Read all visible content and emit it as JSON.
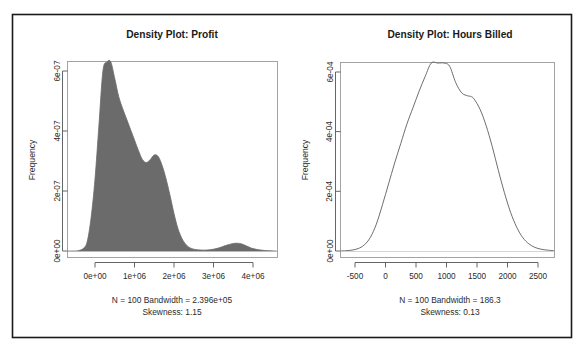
{
  "figure": {
    "background_color": "#ffffff",
    "frame_color": "#1a1a1a",
    "width": 584,
    "height": 354
  },
  "panels": [
    {
      "id": "profit",
      "title": "Density Plot: Profit",
      "ylabel": "Frequency",
      "caption_line1": "N = 100   Bandwidth = 2.396e+05",
      "caption_line2": "Skewness: 1.15",
      "fill_color": "#6b6b6b",
      "line_color": "#5e5e5e",
      "filled": true,
      "xticks": [
        "0e+00",
        "1e+06",
        "2e+06",
        "3e+06",
        "4e+06"
      ],
      "yticks": [
        "0e+00",
        "2e-07",
        "4e-07",
        "6e-07"
      ]
    },
    {
      "id": "hours-billed",
      "title": "Density Plot: Hours Billed",
      "ylabel": "Frequency",
      "caption_line1": "N = 100   Bandwidth = 186.3",
      "caption_line2": "Skewness: 0.13",
      "fill_color": "none",
      "line_color": "#5e5e5e",
      "filled": false,
      "xticks": [
        "-500",
        "0",
        "500",
        "1000",
        "1500",
        "2000",
        "2500"
      ],
      "yticks": [
        "0e+00",
        "2e-04",
        "4e-04",
        "6e-04"
      ]
    }
  ],
  "chart_data": [
    {
      "type": "area",
      "id": "profit",
      "title": "Density Plot: Profit",
      "xlabel": "",
      "ylabel": "Frequency",
      "n": 100,
      "bandwidth": 239600,
      "skewness": 1.15,
      "xlim": [
        -700000,
        4600000
      ],
      "ylim": [
        0,
        7.3e-07
      ],
      "xticks": [
        0,
        1000000,
        2000000,
        3000000,
        4000000
      ],
      "xtick_labels": [
        "0e+00",
        "1e+06",
        "2e+06",
        "3e+06",
        "4e+06"
      ],
      "yticks": [
        0,
        2e-07,
        4e-07,
        6e-07
      ],
      "ytick_labels": [
        "0e+00",
        "2e-07",
        "4e-07",
        "6e-07"
      ],
      "grid": false,
      "legend": "none",
      "fill": "#6b6b6b",
      "x": [
        -700000,
        -600000,
        -500000,
        -400000,
        -300000,
        -200000,
        -100000,
        0,
        100000,
        200000,
        300000,
        400000,
        500000,
        600000,
        700000,
        800000,
        900000,
        1000000,
        1100000,
        1200000,
        1300000,
        1400000,
        1500000,
        1600000,
        1700000,
        1800000,
        1900000,
        2000000,
        2100000,
        2200000,
        2300000,
        2400000,
        2500000,
        2600000,
        2700000,
        2800000,
        2900000,
        3000000,
        3100000,
        3200000,
        3300000,
        3400000,
        3500000,
        3600000,
        3700000,
        3800000,
        3900000,
        4000000,
        4200000,
        4400000,
        4600000
      ],
      "y": [
        0.0,
        0.0,
        0.0,
        2e-09,
        8e-09,
        3e-08,
        1.1e-07,
        2.4e-07,
        4.2e-07,
        6e-07,
        7.05e-07,
        6.6e-07,
        5.75e-07,
        5.15e-07,
        4.75e-07,
        4.4e-07,
        4.05e-07,
        3.7e-07,
        3.35e-07,
        3.05e-07,
        2.95e-07,
        3.05e-07,
        3.2e-07,
        3.15e-07,
        2.85e-07,
        2.4e-07,
        1.85e-07,
        1.25e-07,
        7.5e-08,
        4.2e-08,
        2.2e-08,
        1.1e-08,
        6e-09,
        4e-09,
        3e-09,
        3e-09,
        4e-09,
        6e-09,
        9e-09,
        1.3e-08,
        1.8e-08,
        2.2e-08,
        2.5e-08,
        2.6e-08,
        2.4e-08,
        1.9e-08,
        1.3e-08,
        8e-09,
        3e-09,
        1e-09,
        0.0
      ]
    },
    {
      "type": "line",
      "id": "hours-billed",
      "title": "Density Plot: Hours Billed",
      "xlabel": "",
      "ylabel": "Frequency",
      "n": 100,
      "bandwidth": 186.3,
      "skewness": 0.13,
      "xlim": [
        -750,
        2800
      ],
      "ylim": [
        0,
        0.00069
      ],
      "xticks": [
        -500,
        0,
        500,
        1000,
        1500,
        2000,
        2500
      ],
      "xtick_labels": [
        "-500",
        "0",
        "500",
        "1000",
        "1500",
        "2000",
        "2500"
      ],
      "yticks": [
        0,
        0.0002,
        0.0004,
        0.0006
      ],
      "ytick_labels": [
        "0e+00",
        "2e-04",
        "4e-04",
        "6e-04"
      ],
      "grid": false,
      "legend": "none",
      "fill": "none",
      "x": [
        -750,
        -650,
        -550,
        -450,
        -350,
        -250,
        -150,
        -50,
        50,
        150,
        250,
        350,
        450,
        550,
        650,
        750,
        850,
        900,
        950,
        1050,
        1150,
        1250,
        1350,
        1400,
        1450,
        1550,
        1650,
        1750,
        1850,
        1950,
        2050,
        2150,
        2250,
        2350,
        2450,
        2550,
        2650,
        2750,
        2800
      ],
      "y": [
        0.0,
        1e-06,
        3e-06,
        8e-06,
        2e-05,
        4.5e-05,
        9e-05,
        0.000155,
        0.000225,
        0.000295,
        0.00036,
        0.000425,
        0.00048,
        0.000535,
        0.000585,
        0.00063,
        0.00066,
        0.000662,
        0.000655,
        0.00062,
        0.000565,
        0.00053,
        0.00052,
        0.000518,
        0.00051,
        0.000475,
        0.00042,
        0.00035,
        0.00027,
        0.000195,
        0.00013,
        8e-05,
        4.5e-05,
        2.4e-05,
        1.2e-05,
        6e-06,
        3e-06,
        1e-06,
        0.0
      ]
    }
  ]
}
